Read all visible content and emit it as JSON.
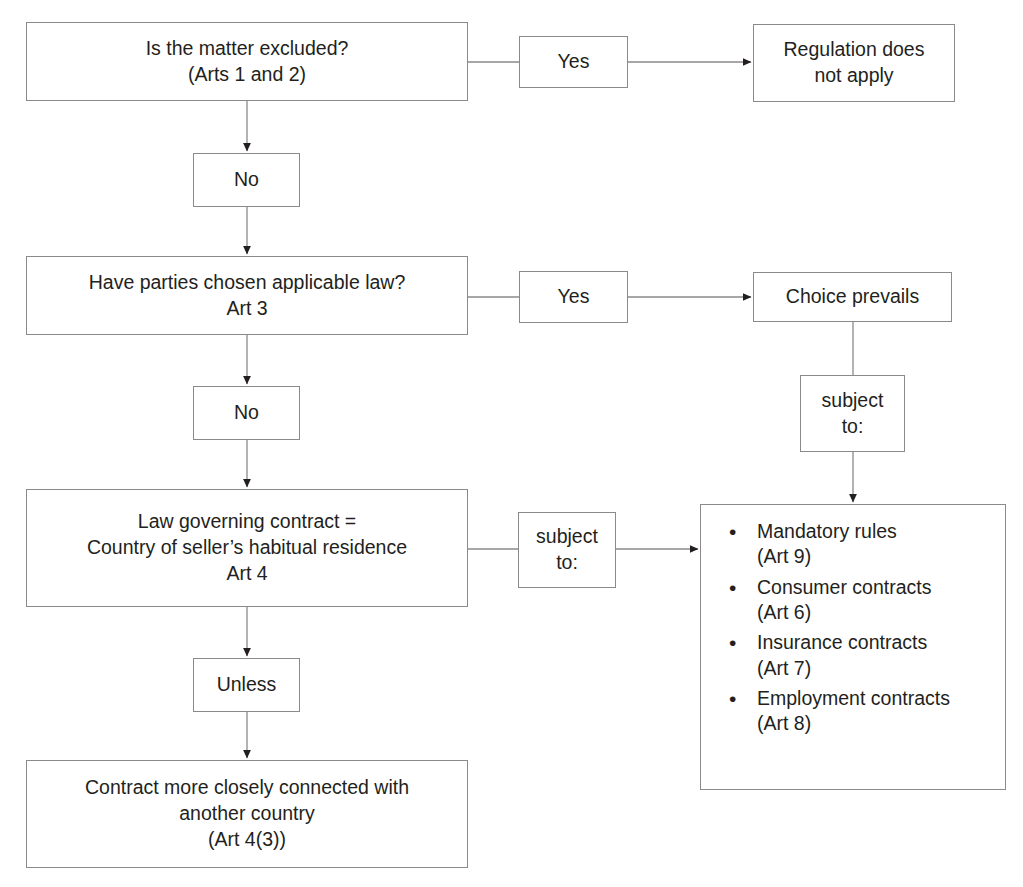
{
  "diagram": {
    "line_color": "#8a8a8a",
    "text_color": "#231f20",
    "arrow_color": "#231f20",
    "background": "#ffffff"
  },
  "nodes": {
    "q1": {
      "id": "q1",
      "text": "Is the matter excluded?\n(Arts 1 and 2)",
      "type": "decision"
    },
    "q1_yes": {
      "id": "q1_yes",
      "text": "Yes",
      "type": "connector-label"
    },
    "q1_yes_result": {
      "id": "q1_yes_result",
      "text": "Regulation does\nnot apply",
      "type": "terminal"
    },
    "q1_no": {
      "id": "q1_no",
      "text": "No",
      "type": "connector-label"
    },
    "q2": {
      "id": "q2",
      "text": "Have parties chosen applicable law?\nArt 3",
      "type": "decision"
    },
    "q2_yes": {
      "id": "q2_yes",
      "text": "Yes",
      "type": "connector-label"
    },
    "q2_yes_result": {
      "id": "q2_yes_result",
      "text": "Choice prevails",
      "type": "terminal"
    },
    "q2_no": {
      "id": "q2_no",
      "text": "No",
      "type": "connector-label"
    },
    "choice_subject_to": {
      "id": "choice_subject_to",
      "text": "subject\nto:",
      "type": "connector-label"
    },
    "q3": {
      "id": "q3",
      "text": "Law governing contract =\nCountry of seller’s habitual residence\nArt 4",
      "type": "decision"
    },
    "q3_subject_to": {
      "id": "q3_subject_to",
      "text": "subject\nto:",
      "type": "connector-label"
    },
    "q3_unless": {
      "id": "q3_unless",
      "text": "Unless",
      "type": "connector-label"
    },
    "q3_unless_result": {
      "id": "q3_unless_result",
      "text": "Contract more closely connected with\nanother country\n(Art 4(3))",
      "type": "terminal"
    },
    "exceptions": {
      "id": "exceptions",
      "type": "list",
      "items": [
        "Mandatory rules\n(Art 9)",
        "Consumer contracts\n(Art 6)",
        "Insurance contracts\n(Art 7)",
        "Employment contracts\n(Art 8)"
      ]
    }
  }
}
